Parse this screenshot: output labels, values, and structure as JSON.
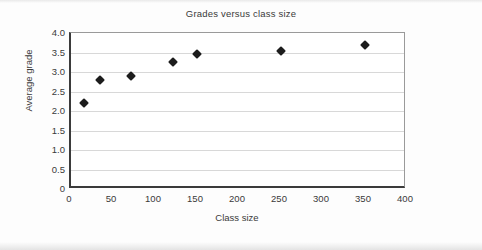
{
  "chart_data": {
    "type": "scatter",
    "title": "Grades versus class size",
    "xlabel": "Class size",
    "ylabel": "Average grade",
    "xlim": [
      0,
      400
    ],
    "ylim": [
      0,
      4.0
    ],
    "grid": true,
    "legend": null,
    "xticks": [
      "0",
      "50",
      "100",
      "150",
      "200",
      "250",
      "300",
      "350",
      "400"
    ],
    "xtick_values": [
      0,
      50,
      100,
      150,
      200,
      250,
      300,
      350,
      400
    ],
    "yticks": [
      "0",
      "0.5",
      "1.0",
      "1.5",
      "2.0",
      "2.5",
      "3.0",
      "3.5",
      "4.0"
    ],
    "ytick_values": [
      0,
      0.5,
      1.0,
      1.5,
      2.0,
      2.5,
      3.0,
      3.5,
      4.0
    ],
    "marker": "diamond",
    "marker_color": "#1c1c1c",
    "points": [
      {
        "x": 16,
        "y": 2.2
      },
      {
        "x": 35,
        "y": 2.8
      },
      {
        "x": 72,
        "y": 2.9
      },
      {
        "x": 122,
        "y": 3.25
      },
      {
        "x": 150,
        "y": 3.45
      },
      {
        "x": 250,
        "y": 3.55
      },
      {
        "x": 350,
        "y": 3.7
      }
    ]
  }
}
